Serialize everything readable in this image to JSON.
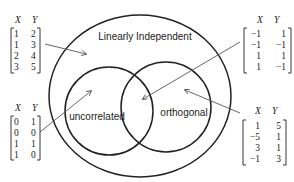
{
  "diagram": {
    "title_cut_off": true,
    "sets": {
      "outer": "Linearly Independent",
      "left": "uncorrelated",
      "right": "orthogonal"
    },
    "matrices": {
      "top_left": {
        "headers": [
          "X",
          "Y"
        ],
        "rows": [
          [
            "1",
            "2"
          ],
          [
            "1",
            "3"
          ],
          [
            "2",
            "4"
          ],
          [
            "3",
            "5"
          ]
        ],
        "points_to": "Linearly Independent only"
      },
      "top_right": {
        "headers": [
          "X",
          "Y"
        ],
        "rows": [
          [
            "−1",
            "1"
          ],
          [
            "−1",
            "−1"
          ],
          [
            "1",
            "1"
          ],
          [
            "1",
            "−1"
          ]
        ],
        "points_to": "uncorrelated and orthogonal (intersection)"
      },
      "bottom_left": {
        "headers": [
          "X",
          "Y"
        ],
        "rows": [
          [
            "0",
            "1"
          ],
          [
            "0",
            "0"
          ],
          [
            "1",
            "1"
          ],
          [
            "1",
            "0"
          ]
        ],
        "points_to": "uncorrelated only"
      },
      "bottom_right": {
        "headers": [
          "X",
          "Y"
        ],
        "rows": [
          [
            "1",
            "5"
          ],
          [
            "−5",
            "1"
          ],
          [
            "3",
            "1"
          ],
          [
            "−1",
            "3"
          ]
        ],
        "points_to": "orthogonal only"
      }
    },
    "colors": {
      "stroke": "#222222",
      "arrow": "#555555",
      "background": "#ffffff"
    }
  }
}
